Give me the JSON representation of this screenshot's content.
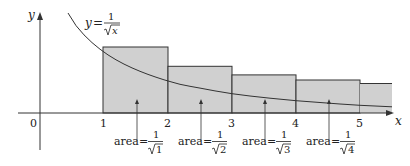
{
  "diagram": {
    "function_label": {
      "lhs": "y",
      "eq": "=",
      "num": "1",
      "rad": "x"
    },
    "axes": {
      "x_label": "x",
      "y_label": "y",
      "origin_label": "0",
      "x_ticks": [
        "1",
        "2",
        "3",
        "4",
        "5"
      ]
    },
    "rectangles": [
      {
        "from": 1,
        "to": 2,
        "height": 1.0
      },
      {
        "from": 2,
        "to": 3,
        "height": 0.7071
      },
      {
        "from": 3,
        "to": 4,
        "height": 0.5774
      },
      {
        "from": 4,
        "to": 5,
        "height": 0.5
      },
      {
        "from": 5,
        "to": 5.5,
        "height": 0.4472
      }
    ],
    "area_labels": [
      {
        "prefix": "area",
        "eq": "=",
        "num": "1",
        "rad": "1"
      },
      {
        "prefix": "area",
        "eq": "=",
        "num": "1",
        "rad": "2"
      },
      {
        "prefix": "area",
        "eq": "=",
        "num": "1",
        "rad": "3"
      },
      {
        "prefix": "area",
        "eq": "=",
        "num": "1",
        "rad": "4"
      }
    ],
    "colors": {
      "fill": "#d0d0d0",
      "stroke": "#333333",
      "curve": "#333333"
    }
  }
}
